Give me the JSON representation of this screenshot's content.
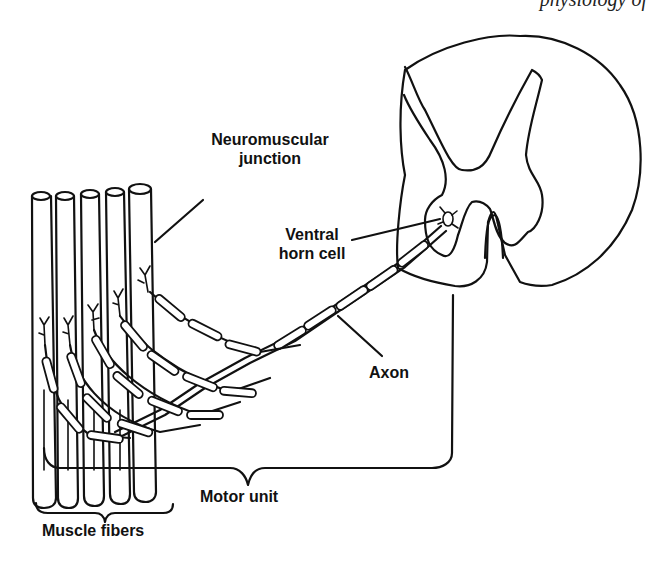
{
  "header": {
    "running_text": "physiology of"
  },
  "diagram": {
    "labels": {
      "neuromuscular_junction_line1": "Neuromuscular",
      "neuromuscular_junction_line2": "junction",
      "ventral_horn_line1": "Ventral",
      "ventral_horn_line2": "horn cell",
      "axon": "Axon",
      "motor_unit": "Motor unit",
      "muscle_fibers": "Muscle fibers"
    },
    "components": {
      "muscle_fiber_count": 5,
      "spinal_cord_cross_section": true,
      "nerve_branch_count": 5
    },
    "colors": {
      "ink": "#111111",
      "background": "#ffffff"
    }
  }
}
